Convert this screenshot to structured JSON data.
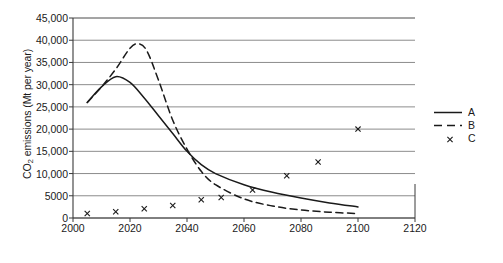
{
  "chart_data": {
    "type": "line",
    "title": "",
    "xlabel": "",
    "ylabel": "CO2 emissions (Mt per year)",
    "ylabel_parts": {
      "prefix": "CO",
      "sub": "2",
      "suffix": " emissions (Mt per year)"
    },
    "xlim": [
      2000,
      2120
    ],
    "ylim": [
      0,
      45000
    ],
    "grid": "horizontal",
    "legend_position": "right",
    "xticks": [
      2000,
      2020,
      2040,
      2060,
      2080,
      2100,
      2120
    ],
    "xtick_labels": [
      "2000",
      "2020",
      "2040",
      "2060",
      "2080",
      "2100",
      "2120"
    ],
    "yticks": [
      0,
      5000,
      10000,
      15000,
      20000,
      25000,
      30000,
      35000,
      40000,
      45000
    ],
    "ytick_labels": [
      "0",
      "5000",
      "10,000",
      "15,000",
      "20,000",
      "25,000",
      "30,000",
      "35,000",
      "40,000",
      "45,000"
    ],
    "series": [
      {
        "name": "A",
        "style": "solid",
        "marker": "none",
        "color": "#1a1a1a",
        "x": [
          2005,
          2010,
          2015,
          2020,
          2025,
          2030,
          2035,
          2040,
          2045,
          2050,
          2060,
          2070,
          2080,
          2090,
          2100
        ],
        "values": [
          26000,
          29500,
          31800,
          30500,
          27000,
          23000,
          19000,
          15000,
          12000,
          10000,
          7500,
          5800,
          4500,
          3400,
          2500
        ]
      },
      {
        "name": "B",
        "style": "dashed",
        "marker": "none",
        "color": "#1a1a1a",
        "x": [
          2005,
          2010,
          2015,
          2020,
          2023,
          2026,
          2030,
          2035,
          2040,
          2045,
          2050,
          2060,
          2070,
          2080,
          2090,
          2100
        ],
        "values": [
          26000,
          29500,
          33500,
          38200,
          39200,
          37500,
          31000,
          22000,
          15500,
          10500,
          7500,
          4300,
          2700,
          1800,
          1300,
          1000
        ]
      },
      {
        "name": "C",
        "style": "none",
        "marker": "x",
        "color": "#1a1a1a",
        "x": [
          2005,
          2015,
          2025,
          2035,
          2045,
          2052,
          2063,
          2075,
          2086,
          2100
        ],
        "values": [
          1000,
          1400,
          2100,
          2800,
          4100,
          4600,
          6300,
          9500,
          12600,
          20000
        ]
      }
    ]
  },
  "legend": {
    "entries": [
      {
        "label": "A",
        "style": "solid"
      },
      {
        "label": "B",
        "style": "dashed"
      },
      {
        "label": "C",
        "style": "marker"
      }
    ]
  },
  "caption": {
    "text": ""
  }
}
